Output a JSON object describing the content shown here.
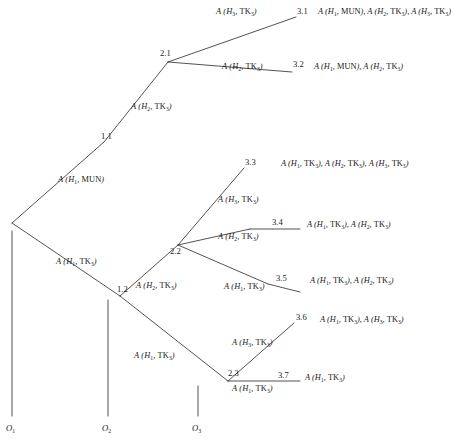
{
  "diagram": {
    "type": "decision-tree",
    "root_node": "",
    "axes": [
      {
        "id": "o1",
        "label": "O₁"
      },
      {
        "id": "o2",
        "label": "O₂"
      },
      {
        "id": "o3",
        "label": "O₃"
      }
    ],
    "internal_nodes": [
      {
        "id": "1.1",
        "label": "1.1"
      },
      {
        "id": "1.2",
        "label": "1.2"
      },
      {
        "id": "2.1",
        "label": "2.1"
      },
      {
        "id": "2.2",
        "label": "2.2"
      },
      {
        "id": "2.3",
        "label": "2.3"
      }
    ],
    "terminal_nodes": [
      {
        "id": "3.1",
        "label": "3.1"
      },
      {
        "id": "3.2",
        "label": "3.2"
      },
      {
        "id": "3.3",
        "label": "3.3"
      },
      {
        "id": "3.4",
        "label": "3.4"
      },
      {
        "id": "3.5",
        "label": "3.5"
      },
      {
        "id": "3.6",
        "label": "3.6"
      },
      {
        "id": "3.7",
        "label": "3.7"
      }
    ],
    "branch_labels": [
      {
        "id": "root-upper",
        "text": "A (H1, MUN)"
      },
      {
        "id": "root-lower",
        "text": "A (H1, TK3)"
      },
      {
        "id": "n11-to-21",
        "text": "A (H2, TK3)"
      },
      {
        "id": "n21-to-31",
        "text": "A (H3, TK3)"
      },
      {
        "id": "n21-to-32",
        "text": "A (H2, TK3)"
      },
      {
        "id": "n12-to-22",
        "text": "A (H2, TK3)"
      },
      {
        "id": "n12-to-23",
        "text": "A (H1, TK3)"
      },
      {
        "id": "n22-to-33",
        "text": "A (H3, TK3)"
      },
      {
        "id": "n22-to-34",
        "text": "A (H2, TK3)"
      },
      {
        "id": "n22-to-35",
        "text": "A (H1, TK3)"
      },
      {
        "id": "n23-to-36",
        "text": "A (H3, TK3)"
      },
      {
        "id": "n23-to-37",
        "text": "A (H1, TK3)"
      }
    ],
    "outcomes": [
      {
        "id": "3.1",
        "text": "A (H1, MUN), A (H2, TK3), A (H3, TK3)"
      },
      {
        "id": "3.2",
        "text": "A (H1, MUN), A (H2, TK3)"
      },
      {
        "id": "3.3",
        "text": "A (H1, TK3), A (H2, TK3), A (H3, TK3)"
      },
      {
        "id": "3.4",
        "text": "A (H1, TK3), A (H2, TK3)"
      },
      {
        "id": "3.5",
        "text": "A (H1, TK3), A (H2, TK3)"
      },
      {
        "id": "3.6",
        "text": "A (H1, TK3), A (H3, TK3)"
      },
      {
        "id": "3.7",
        "text": "A (H1, TK3)"
      }
    ]
  }
}
